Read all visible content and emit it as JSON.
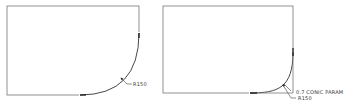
{
  "diagrams": [
    {
      "name": "circular-fillet",
      "box": {
        "x": 7,
        "y": 6,
        "w": 132,
        "h": 89
      },
      "curve": "M 80 95 Q 139 95 139 33",
      "leader": "M 121 78 L 127 84 L 132 84",
      "label": "R150"
    },
    {
      "name": "conic-fillet",
      "box": {
        "x": 163,
        "y": 6,
        "w": 130,
        "h": 87
      },
      "curve": "M 250 93 Q 293 93 293 52",
      "leader1": "M 284 83 L 291 90",
      "leader2": "M 282 85 L 291 99 L 296 99",
      "label_conic": "0.7 CONIC PARAM",
      "label_radius": "R150"
    }
  ],
  "colors": {
    "line": "#555555",
    "curve": "#333333",
    "text": "#333333"
  }
}
